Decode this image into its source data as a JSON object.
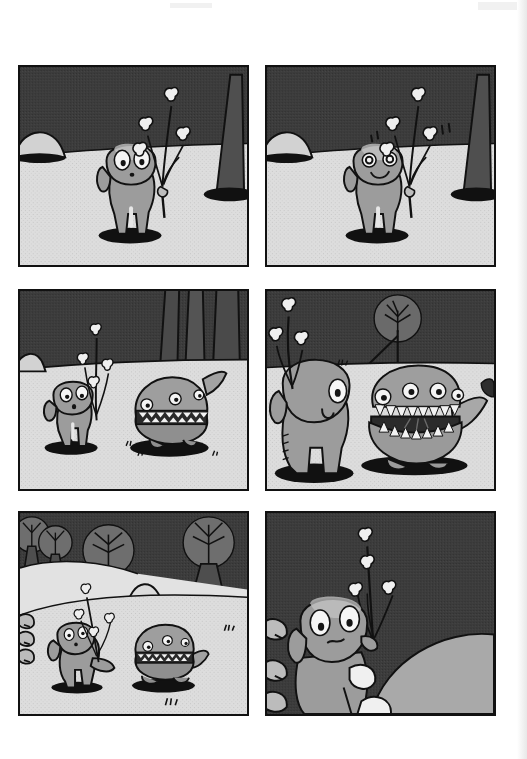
{
  "page": {
    "kind": "comic-page",
    "medium": "grayscale halftone scan",
    "background_color": "#ffffff",
    "width": 527,
    "height": 759,
    "has_text": false,
    "note": "Wordless six-panel comic strip, no captions or speech balloons visible"
  },
  "palette": {
    "ink": "#111111",
    "sky_dark": "#3c3c3c",
    "sky_mid": "#4a4a4a",
    "ground_light": "#dcdcdc",
    "ground_shadow": "#c9c9c9",
    "creature_body": "#9a9a9a",
    "creature_highlight": "#c2c2c2",
    "eye_white": "#f4f4f4",
    "tooth_white": "#f2f2f2",
    "paper": "#ffffff"
  },
  "layout": {
    "rows": 3,
    "columns": 2,
    "gutter_x": 16,
    "gutter_y": 18,
    "panel_width": 231,
    "panel_height": 202,
    "margin_left": 18,
    "margin_top": 65
  },
  "panels": [
    {
      "id": "panel-1",
      "index": 1,
      "row": 1,
      "column": 1,
      "x": 18,
      "y": 65,
      "w": 231,
      "h": 202,
      "caption": "",
      "scene": "Small round-headed creature stands on pale ground holding a sprig of bud-tipped branches; dark sky behind, a dome rock at left and a cone-shaped tree trunk at right",
      "sky_color": "#3c3c3c",
      "ground_color": "#dcdcdc",
      "horizon_ratio": 0.45,
      "characters": [
        {
          "name": "sprout-creature",
          "expression": "wide-eyed neutral",
          "eyes": "two large white ovals with small dark pupils",
          "mouth": "small dark dot",
          "holding": "branch sprig with four bud blossoms",
          "pose": "standing, two legs, shadow below"
        }
      ],
      "props": [
        "dome-rock-left",
        "cone-tree-right",
        "ground-shadow-ellipse"
      ]
    },
    {
      "id": "panel-2",
      "index": 2,
      "row": 1,
      "column": 2,
      "x": 265,
      "y": 65,
      "w": 231,
      "h": 202,
      "caption": "",
      "scene": "Same framing as panel 1; the creature now smiles happily with ring-shaped eyes and small motion ticks float beside the branch",
      "sky_color": "#3c3c3c",
      "ground_color": "#dcdcdc",
      "horizon_ratio": 0.45,
      "characters": [
        {
          "name": "sprout-creature",
          "expression": "happy / smiling",
          "eyes": "two circular ring eyes",
          "mouth": "upturned smile curve",
          "holding": "branch sprig with four bud blossoms",
          "pose": "standing, two legs, shadow below"
        }
      ],
      "props": [
        "dome-rock-left",
        "cone-tree-right",
        "motion-tick-marks",
        "ground-shadow-ellipse"
      ]
    },
    {
      "id": "panel-3",
      "index": 3,
      "row": 2,
      "column": 1,
      "x": 18,
      "y": 289,
      "w": 231,
      "h": 202,
      "caption": "",
      "scene": "The creature, seen smaller at left, faces a squat dome-shaped many-eyed creature at right that has a band of teeth around its middle and a tail fin; tall dark trunks rise behind",
      "sky_color": "#3c3c3c",
      "ground_color": "#dcdcdc",
      "horizon_ratio": 0.4,
      "characters": [
        {
          "name": "sprout-creature",
          "expression": "surprised",
          "eyes": "two white ovals with pupils",
          "mouth": "small open dot",
          "holding": "branch sprig",
          "pose": "standing facing right"
        },
        {
          "name": "toothy-dome-creature",
          "expression": "closed toothy band",
          "eyes": "three to four small white eyes on dome",
          "mouth": "horizontal band of zigzag teeth",
          "pose": "squat dome with stubby base and tail fin"
        }
      ],
      "props": [
        "tall-trunks-background",
        "ground-shadow-ellipses",
        "small-grass-tufts"
      ]
    },
    {
      "id": "panel-4",
      "index": 4,
      "row": 2,
      "column": 2,
      "x": 265,
      "y": 289,
      "w": 231,
      "h": 202,
      "caption": "",
      "scene": "Close-up: the toothy creature yawns its mouth wide open showing two rows of pointed teeth and a dark throat; the sprout-creature stands at left in silhouette-like closeup; a round tree-in-a-circle shape sits on the horizon",
      "sky_color": "#3c3c3c",
      "ground_color": "#dcdcdc",
      "horizon_ratio": 0.42,
      "characters": [
        {
          "name": "sprout-creature",
          "expression": "side view, single visible eye",
          "eyes": "one large white oval with pupil",
          "mouth": "small curved line",
          "holding": "branch sprig over shoulder",
          "pose": "close-up, back-three-quarter, facing right"
        },
        {
          "name": "toothy-dome-creature",
          "expression": "mouth gaping wide",
          "eyes": "four small white eyes across the upper dome",
          "mouth": "wide open with upper and lower rows of triangular teeth, dark interior",
          "pose": "facing viewer, tail fin curling right"
        }
      ],
      "props": [
        "circle-tree-on-horizon",
        "tiny-tuft-on-horizon",
        "ground-shadow-ellipses"
      ]
    },
    {
      "id": "panel-5",
      "index": 5,
      "row": 3,
      "column": 1,
      "x": 18,
      "y": 511,
      "w": 231,
      "h": 205,
      "caption": "",
      "scene": "Wide landscape: four round-canopy trees on a rolling hill, a smooth cone hill in the middle distance; the sprout-creature walks left-to-right toward the toothy dome creature across pale ground; small tufts dot the field",
      "sky_color": "#3c3c3c",
      "ground_color": "#dcdcdc",
      "horizon_ratio": 0.38,
      "characters": [
        {
          "name": "sprout-creature",
          "expression": "looking up, small eyes",
          "holding": "branch sprig",
          "pose": "walking, mid-stride, arm extended"
        },
        {
          "name": "toothy-dome-creature",
          "expression": "calm, teeth band closed",
          "pose": "squat, facing left, tail fin at right"
        }
      ],
      "props": [
        "round-canopy-trees",
        "cone-hill",
        "bush-left",
        "grass-tufts",
        "ground-shadow-ellipses"
      ]
    },
    {
      "id": "panel-6",
      "index": 6,
      "row": 3,
      "column": 2,
      "x": 265,
      "y": 511,
      "w": 231,
      "h": 205,
      "caption": "",
      "scene": "Close-up: the sprout-creature peers worriedly over a huge pale sloping mass that fills the lower right of the frame; its branch sprig rises high into the dark sky; a bush sits at far left",
      "sky_color": "#3c3c3c",
      "ground_color": "#a8a8a8",
      "horizon_ratio": 0.6,
      "characters": [
        {
          "name": "sprout-creature",
          "expression": "worried / uneasy",
          "eyes": "two large white ovals with small dark pupils",
          "mouth": "small wavy frown",
          "holding": "tall branch sprig with bud blossoms",
          "pose": "close-up, leaning against a large form"
        }
      ],
      "props": [
        "large-pale-mass",
        "bush-left",
        "pale-lumps-foreground"
      ]
    }
  ],
  "scan_artifacts": [
    {
      "name": "top-right-smudge",
      "x": 478,
      "y": 2,
      "w": 40,
      "h": 8
    },
    {
      "name": "top-center-faint-band",
      "x": 170,
      "y": 3,
      "w": 42,
      "h": 5
    },
    {
      "name": "right-edge-shading",
      "x": 517,
      "y": 0,
      "w": 10,
      "h": 759
    }
  ]
}
